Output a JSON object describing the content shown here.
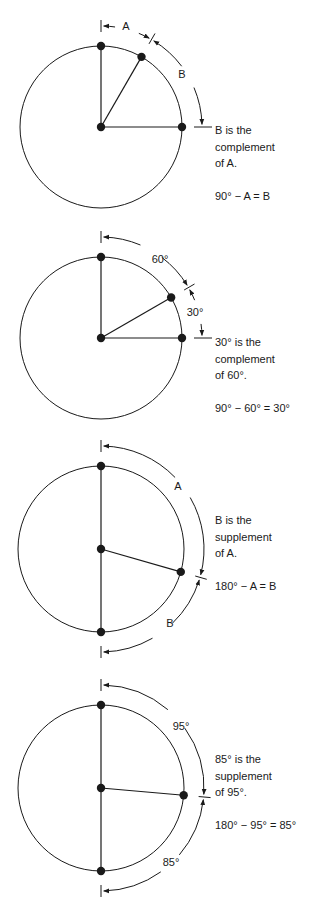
{
  "figure": {
    "panels": [
      {
        "id": "complement-general",
        "center": [
          101,
          127
        ],
        "radius": 81,
        "angle_deg": 30,
        "reference": "quarter",
        "arc_labels": [
          {
            "text": "A",
            "x": 126,
            "y": 30
          },
          {
            "text": "B",
            "x": 182,
            "y": 78
          }
        ],
        "caption": {
          "lines": [
            "B is the",
            "complement",
            "of A."
          ],
          "equation": "90° − A = B",
          "top": 122
        }
      },
      {
        "id": "complement-example",
        "center": [
          101,
          338
        ],
        "radius": 81,
        "angle_deg": 60,
        "reference": "quarter",
        "arc_labels": [
          {
            "text": "60°",
            "x": 160,
            "y": 263
          },
          {
            "text": "30°",
            "x": 195,
            "y": 316
          }
        ],
        "caption": {
          "lines": [
            "30° is the",
            "complement",
            "of 60°."
          ],
          "equation": "90° − 60° = 30°",
          "top": 334
        }
      },
      {
        "id": "supplement-general",
        "center": [
          101,
          549
        ],
        "radius": 83,
        "angle_deg": 106,
        "reference": "half",
        "arc_labels": [
          {
            "text": "A",
            "x": 178,
            "y": 490
          },
          {
            "text": "B",
            "x": 170,
            "y": 627
          }
        ],
        "caption": {
          "lines": [
            "B is the",
            "supplement",
            "of A."
          ],
          "equation": "180° − A = B",
          "top": 512
        }
      },
      {
        "id": "supplement-example",
        "center": [
          101,
          788
        ],
        "radius": 83,
        "angle_deg": 95,
        "reference": "half",
        "arc_labels": [
          {
            "text": "95°",
            "x": 181,
            "y": 730
          },
          {
            "text": "85°",
            "x": 171,
            "y": 866
          }
        ],
        "caption": {
          "lines": [
            "85° is the",
            "supplement",
            "of 95°."
          ],
          "equation": "180° − 95° = 85°",
          "top": 751
        }
      }
    ],
    "colors": {
      "stroke": "#1a1a1a",
      "background": "#ffffff"
    }
  }
}
